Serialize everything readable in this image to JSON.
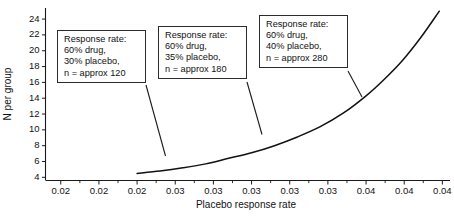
{
  "chart_data": {
    "type": "line",
    "title": "",
    "xlabel": "Placebo response rate",
    "ylabel": "N per group",
    "xlim": [
      0.019,
      0.0455
    ],
    "ylim": [
      3.6,
      25.4
    ],
    "grid": false,
    "legend": null,
    "x_tick_labels": [
      "0.02",
      "0.02",
      "0.02",
      "0.03",
      "0.03",
      "0.03",
      "0.03",
      "0.03",
      "0.04",
      "0.04",
      "0.04"
    ],
    "x_tick_values": [
      0.02,
      0.0225,
      0.025,
      0.0275,
      0.03,
      0.0325,
      0.035,
      0.0375,
      0.04,
      0.0425,
      0.045
    ],
    "y_tick_labels": [
      "4",
      "6",
      "8",
      "10",
      "12",
      "14",
      "16",
      "18",
      "20",
      "22",
      "24"
    ],
    "y_tick_values": [
      4,
      6,
      8,
      10,
      12,
      14,
      16,
      18,
      20,
      22,
      24
    ],
    "series": [
      {
        "name": "Sample size curve",
        "x": [
          0.025,
          0.0265,
          0.028,
          0.0295,
          0.031,
          0.0325,
          0.034,
          0.0355,
          0.037,
          0.0385,
          0.04,
          0.0412,
          0.0424,
          0.0436,
          0.0448
        ],
        "y": [
          4.5,
          4.8,
          5.2,
          5.7,
          6.4,
          7.1,
          8.0,
          9.1,
          10.4,
          12.1,
          14.3,
          16.4,
          18.8,
          21.7,
          25.0
        ]
      }
    ],
    "annotations": [
      {
        "id": "callout-1",
        "lines": [
          "Response rate:",
          "60% drug,",
          "30% placebo,",
          "n = approx 120"
        ],
        "response_rate_drug": "60%",
        "response_rate_placebo": "30%",
        "n_per_group": "approx 120",
        "points_to": {
          "x": 0.03,
          "y": 6.2
        }
      },
      {
        "id": "callout-2",
        "lines": [
          "Response rate:",
          "60% drug,",
          "35% placebo,",
          "n = approx 180"
        ],
        "response_rate_drug": "60%",
        "response_rate_placebo": "35%",
        "n_per_group": "approx 180",
        "points_to": {
          "x": 0.035,
          "y": 8.3
        }
      },
      {
        "id": "callout-3",
        "lines": [
          "Response rate:",
          "60% drug,",
          "40% placebo,",
          "n = approx 280"
        ],
        "response_rate_drug": "60%",
        "response_rate_placebo": "40%",
        "n_per_group": "approx 280",
        "points_to": {
          "x": 0.04,
          "y": 14.2
        }
      }
    ]
  },
  "callouts": {
    "c1": {
      "l1": "Response rate:",
      "l2": "60% drug,",
      "l3": "30% placebo,",
      "l4": "n = approx 120"
    },
    "c2": {
      "l1": "Response rate:",
      "l2": "60% drug,",
      "l3": "35% placebo,",
      "l4": "n = approx 180"
    },
    "c3": {
      "l1": "Response rate:",
      "l2": "60% drug,",
      "l3": "40% placebo,",
      "l4": "n = approx 280"
    }
  },
  "axes": {
    "x_title": "Placebo response rate",
    "y_title": "N per group"
  },
  "colors": {
    "curve": "#111111",
    "axis": "#1a1a1a",
    "text": "#111111",
    "background": "#ffffff",
    "callout_border": "#2b2b2b"
  }
}
